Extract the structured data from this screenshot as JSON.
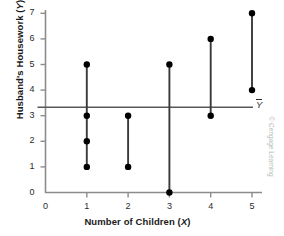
{
  "chart_data": {
    "type": "scatter",
    "title": "",
    "xlabel": "Number of Children (X)",
    "xlabel_plain": "Number of Children",
    "xlabel_var": "X",
    "ylabel": "Husband's Housework (Y)",
    "ylabel_plain": "Husband's Housework",
    "ylabel_var": "Y",
    "xlim": [
      0,
      5.6
    ],
    "ylim": [
      0,
      7.3
    ],
    "xticks": [
      0,
      1,
      2,
      3,
      4,
      5
    ],
    "yticks": [
      0,
      1,
      2,
      3,
      4,
      5,
      6,
      7
    ],
    "grid": false,
    "legend": null,
    "points": [
      {
        "x": 1,
        "y": 5
      },
      {
        "x": 1,
        "y": 3
      },
      {
        "x": 1,
        "y": 2
      },
      {
        "x": 1,
        "y": 1
      },
      {
        "x": 2,
        "y": 3
      },
      {
        "x": 2,
        "y": 1
      },
      {
        "x": 3,
        "y": 5
      },
      {
        "x": 3,
        "y": 0
      },
      {
        "x": 4,
        "y": 6
      },
      {
        "x": 4,
        "y": 3
      },
      {
        "x": 5,
        "y": 7
      },
      {
        "x": 5,
        "y": 4
      }
    ],
    "connectors": [
      {
        "x": 1,
        "y_min": 1,
        "y_max": 5
      },
      {
        "x": 2,
        "y_min": 1,
        "y_max": 3
      },
      {
        "x": 3,
        "y_min": 0,
        "y_max": 5
      },
      {
        "x": 4,
        "y_min": 3,
        "y_max": 6
      },
      {
        "x": 5,
        "y_min": 4,
        "y_max": 7
      }
    ],
    "mean_line": {
      "value": 3.33,
      "label": "Y",
      "label_note": "Y with overbar (Y-bar), the mean of Y",
      "orientation": "horizontal"
    },
    "colors": {
      "marker": "#000000",
      "connector": "#3a3a3a",
      "axis": "#8c8c8c",
      "mean_line": "#585858",
      "text": "#1a1a1a",
      "background": "#ffffff",
      "credit": "#b9b9b9"
    }
  },
  "credit": {
    "text": "© Cengage Learning"
  }
}
